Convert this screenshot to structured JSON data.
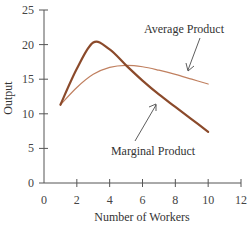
{
  "chart_data": {
    "type": "line",
    "title": "",
    "xlabel": "Number of Workers",
    "ylabel": "Output",
    "xlim": [
      0,
      12
    ],
    "ylim": [
      0,
      25
    ],
    "x_ticks": [
      0,
      2,
      4,
      6,
      8,
      10,
      12
    ],
    "y_ticks": [
      0,
      5,
      10,
      15,
      20,
      25
    ],
    "grid": false,
    "legend": "none (inline annotations)",
    "series": [
      {
        "name": "Marginal Product",
        "color": "#8b4a2b",
        "x": [
          1,
          2,
          3,
          4,
          5,
          6,
          7,
          8,
          9,
          10
        ],
        "y": [
          11.3,
          16.5,
          20.3,
          19.3,
          17.0,
          14.8,
          12.8,
          11.0,
          9.2,
          7.4
        ]
      },
      {
        "name": "Average Product",
        "color": "#c08060",
        "x": [
          1,
          2,
          3,
          4,
          5,
          6,
          7,
          8,
          9,
          10
        ],
        "y": [
          11.3,
          13.8,
          15.7,
          16.7,
          17.0,
          16.8,
          16.3,
          15.7,
          15.0,
          14.3
        ]
      }
    ],
    "annotations": [
      {
        "text": "Average Product",
        "points_to": "Average Product curve"
      },
      {
        "text": "Marginal Product",
        "points_to": "Marginal Product curve"
      }
    ]
  }
}
